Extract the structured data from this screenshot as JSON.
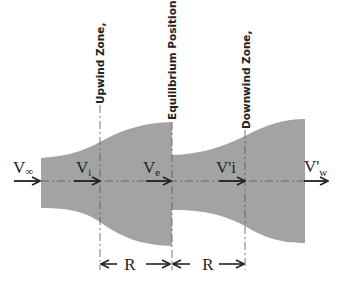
{
  "diagram": {
    "zone_labels": {
      "upwind": "Upwind Zone,",
      "equilibrium": "Equilibrium Position,",
      "downwind": "Downwind Zone,"
    },
    "velocities": {
      "freestream": {
        "main": "V",
        "sub": "∞"
      },
      "upwind_induced": {
        "main": "V",
        "sub": "i"
      },
      "equilibrium": {
        "main": "V",
        "sub": "e"
      },
      "downwind_induced": {
        "main": "V'i",
        "sub": ""
      },
      "wake": {
        "main": "V'",
        "sub": "w"
      }
    },
    "dimensions": {
      "upwind_radius": "R",
      "downwind_radius": "R"
    },
    "colors": {
      "tube_fill": "#a3a3a3",
      "line": "#222222",
      "background": "#ffffff"
    }
  }
}
